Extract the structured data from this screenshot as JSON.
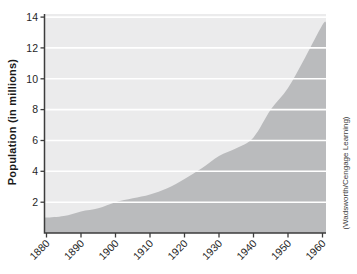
{
  "figure": {
    "ylabel": "Population (in millions)",
    "credit": "(Wadsworth/Cengage Learning)"
  },
  "colors": {
    "plot_bg": "#ebebec",
    "area_fill": "#babbbd",
    "gridline": "#ffffff",
    "axis": "#3d3d3d",
    "tick_text": "#1f1f1f"
  },
  "chart_data": {
    "type": "area",
    "title": "",
    "xlabel": "",
    "ylabel": "Population (in millions)",
    "categories": [
      1880,
      1890,
      1900,
      1910,
      1920,
      1930,
      1940,
      1950,
      1960
    ],
    "values": [
      1.0,
      1.4,
      2.0,
      2.5,
      3.5,
      5.0,
      6.2,
      9.4,
      13.5
    ],
    "curve_points": {
      "x": [
        1880,
        1885,
        1890,
        1895,
        1900,
        1905,
        1910,
        1915,
        1920,
        1925,
        1930,
        1935,
        1940,
        1945,
        1950,
        1955,
        1960
      ],
      "y": [
        1.0,
        1.1,
        1.4,
        1.6,
        2.0,
        2.25,
        2.5,
        2.9,
        3.5,
        4.2,
        5.0,
        5.5,
        6.2,
        8.0,
        9.4,
        11.4,
        13.5
      ]
    },
    "xlim": [
      1880,
      1960
    ],
    "ylim": [
      0,
      14.2
    ],
    "xticks": [
      1880,
      1890,
      1900,
      1910,
      1920,
      1930,
      1940,
      1950,
      1960
    ],
    "yticks": [
      2,
      4,
      6,
      8,
      10,
      12,
      14
    ],
    "grid": true,
    "gridline_color": "white",
    "legend": false,
    "annotations": [
      "(Wadsworth/Cengage Learning)"
    ]
  }
}
